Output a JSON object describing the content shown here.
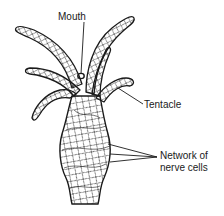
{
  "diagram": {
    "labels": {
      "mouth": "Mouth",
      "tentacle": "Tentacle",
      "network_line1": "Network of",
      "network_line2": "nerve cells"
    },
    "colors": {
      "ink": "#1a1a1a",
      "background": "#ffffff"
    }
  }
}
